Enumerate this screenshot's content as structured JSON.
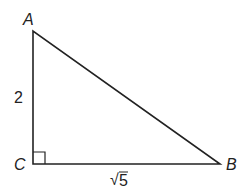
{
  "diagram": {
    "type": "right-triangle",
    "vertices": [
      {
        "name": "A",
        "x": 33,
        "y": 31
      },
      {
        "name": "C",
        "x": 33,
        "y": 164
      },
      {
        "name": "B",
        "x": 220,
        "y": 164
      }
    ],
    "labels": {
      "A": "A",
      "B": "B",
      "C": "C",
      "side_AC": "2",
      "side_CB_radicand": "5",
      "side_CB_symbol": "√"
    },
    "right_angle_at": "C",
    "stroke_color": "#222222"
  }
}
